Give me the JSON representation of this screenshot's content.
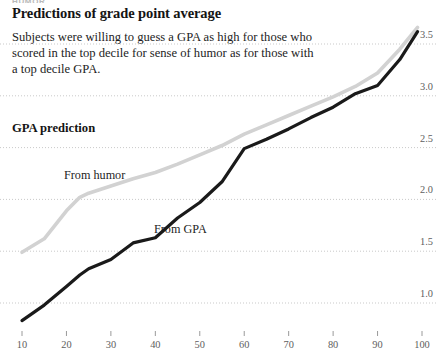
{
  "kicker": "HUMOR",
  "header": {
    "title": "Predictions of grade point average",
    "subtitle": "Subjects were willing to guess a GPA as high for those who scored in the top decile for sense of humor as for those with a top decile GPA."
  },
  "axis_title": "GPA prediction",
  "colors": {
    "humor_line": "#d2d2d2",
    "gpa_line": "#1a1a1a",
    "gridline": "#c9c9c9",
    "tick_text": "#5e5e5e"
  },
  "chart_data": {
    "type": "line",
    "title": "GPA prediction",
    "xlabel": "",
    "ylabel": "GPA prediction",
    "xlim": [
      5,
      102
    ],
    "ylim": [
      0.72,
      3.72
    ],
    "grid": true,
    "legend": "inline-labels",
    "xticks": [
      10,
      20,
      30,
      40,
      50,
      60,
      70,
      80,
      90,
      100
    ],
    "yticks": [
      1.0,
      1.5,
      2.0,
      2.5,
      3.0,
      3.5
    ],
    "xtick_labels": [
      "10",
      "20",
      "30",
      "40",
      "50",
      "60",
      "70",
      "80",
      "90",
      "100"
    ],
    "ytick_labels": [
      "1.0",
      "1.5",
      "2.0",
      "2.5",
      "3.0",
      "3.5"
    ],
    "series": [
      {
        "name": "From humor",
        "color": "#d2d2d2",
        "x": [
          10,
          15,
          20,
          23,
          25,
          30,
          35,
          40,
          45,
          50,
          55,
          60,
          65,
          70,
          75,
          80,
          85,
          90,
          95,
          99
        ],
        "values": [
          1.49,
          1.62,
          1.89,
          2.02,
          2.06,
          2.13,
          2.2,
          2.26,
          2.34,
          2.43,
          2.52,
          2.63,
          2.72,
          2.81,
          2.9,
          2.99,
          3.09,
          3.22,
          3.45,
          3.66
        ]
      },
      {
        "name": "From GPA",
        "color": "#1a1a1a",
        "x": [
          10,
          15,
          20,
          23,
          25,
          30,
          35,
          40,
          45,
          50,
          55,
          60,
          65,
          70,
          75,
          80,
          85,
          90,
          95,
          99
        ],
        "values": [
          0.83,
          0.98,
          1.16,
          1.27,
          1.33,
          1.42,
          1.58,
          1.63,
          1.82,
          1.97,
          2.17,
          2.49,
          2.58,
          2.68,
          2.79,
          2.89,
          3.02,
          3.1,
          3.35,
          3.62
        ]
      }
    ]
  }
}
